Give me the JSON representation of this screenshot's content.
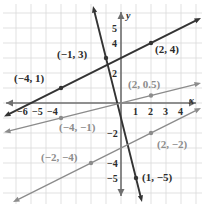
{
  "chart_data": {
    "type": "line",
    "title": "",
    "xlabel": "x",
    "ylabel": "y",
    "xlim": [
      -6.8,
      4.8
    ],
    "ylim": [
      -6.2,
      5.9
    ],
    "grid": true,
    "legend": "none",
    "x_ticks": [
      -6,
      -5,
      -4,
      1,
      2,
      3,
      4
    ],
    "x_tick_labels": [
      "−6",
      "−5",
      "−4",
      "1",
      "2",
      "3",
      "4"
    ],
    "y_ticks": [
      5,
      4,
      2,
      -2,
      -4,
      -5
    ],
    "y_tick_labels": [
      "5",
      "4",
      "2",
      "−2",
      "−4",
      "−5"
    ],
    "series": [
      {
        "name": "line-steep-black",
        "color": "#333333",
        "slope": -4,
        "intercept": -1,
        "arrows": "both",
        "points": [
          {
            "x": -1,
            "y": 3,
            "label": "(−1, 3)",
            "color": "#2b2b2b"
          },
          {
            "x": 1,
            "y": -5,
            "label": "(1, −5)",
            "color": "#2b2b2b"
          }
        ]
      },
      {
        "name": "line-medium-black",
        "color": "#333333",
        "slope": 0.5,
        "intercept": 3,
        "arrows": "both",
        "points": [
          {
            "x": -4,
            "y": 1,
            "label": "(−4, 1)",
            "color": "#2b2b2b"
          },
          {
            "x": 2,
            "y": 4,
            "label": "(2, 4)",
            "color": "#2b2b2b"
          }
        ]
      },
      {
        "name": "line-shallow-gray-upper",
        "color": "#8c8c8c",
        "slope": 0.25,
        "intercept": 0,
        "arrows": "both",
        "points": [
          {
            "x": 2,
            "y": 0.5,
            "label": "(2, 0.5)",
            "color": "#8c8c8c"
          },
          {
            "x": -4,
            "y": -1,
            "label": "(−4, −1)",
            "color": "#8c8c8c"
          }
        ]
      },
      {
        "name": "line-shallow-gray-lower",
        "color": "#8c8c8c",
        "slope": 0.5,
        "intercept": -3,
        "arrows": "both",
        "points": [
          {
            "x": 2,
            "y": -2,
            "label": "(2, −2)",
            "color": "#8c8c8c"
          },
          {
            "x": -2,
            "y": -4,
            "label": "(−2, −4)",
            "color": "#8c8c8c"
          }
        ]
      }
    ],
    "annotations": [
      {
        "text": "(−1, 3)",
        "x": -1,
        "y": 3
      },
      {
        "text": "(2, 4)",
        "x": 2,
        "y": 4
      },
      {
        "text": "(−4, 1)",
        "x": -4,
        "y": 1
      },
      {
        "text": "(2, 0.5)",
        "x": 2,
        "y": 0.5
      },
      {
        "text": "(−4, −1)",
        "x": -4,
        "y": -1
      },
      {
        "text": "(2, −2)",
        "x": 2,
        "y": -2
      },
      {
        "text": "(−2, −4)",
        "x": -2,
        "y": -4
      },
      {
        "text": "(1, −5)",
        "x": 1,
        "y": -5
      }
    ],
    "colors": {
      "grid": "#d9d9d9",
      "axis": "#6f6f6f",
      "dark_line": "#333333",
      "gray_line": "#8c8c8c",
      "text": "#2b2b2b",
      "gray_text": "#8c8c8c",
      "background": "#ffffff"
    }
  },
  "labels": {
    "axis_x": "x",
    "axis_y": "y",
    "tick_xm6": "−6",
    "tick_xm5": "−5",
    "tick_xm4": "−4",
    "tick_x1": "1",
    "tick_x2": "2",
    "tick_x3": "3",
    "tick_x4": "4",
    "tick_y5": "5",
    "tick_y4": "4",
    "tick_y2": "2",
    "tick_ym2": "−2",
    "tick_ym4": "−4",
    "tick_ym5": "−5",
    "p_m1_3": "(−1, 3)",
    "p_2_4": "(2, 4)",
    "p_m4_1": "(−4, 1)",
    "p_2_05": "(2, 0.5)",
    "p_m4_m1": "(−4, −1)",
    "p_2_m2": "(2, −2)",
    "p_m2_m4": "(−2, −4)",
    "p_1_m5": "(1, −5)"
  }
}
